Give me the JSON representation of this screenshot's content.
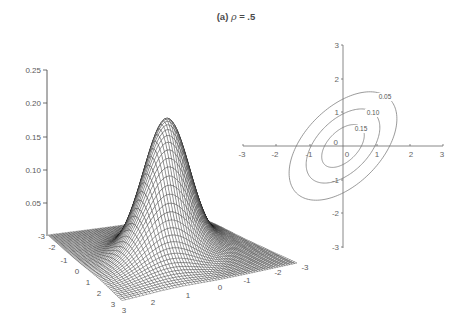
{
  "title": {
    "label": "(a)",
    "symbol": "ρ",
    "value": "= .5"
  },
  "chart_data": [
    {
      "type": "surface",
      "title": "(a) ρ = .5",
      "description": "bivariate normal density surface",
      "rho": 0.5,
      "x_range": [
        -3,
        3
      ],
      "y_range": [
        -3,
        3
      ],
      "zlim": [
        0,
        0.25
      ],
      "peak_value": 0.184,
      "zticks": [
        "0.25",
        "0.20",
        "0.15",
        "0.10",
        "0.05"
      ],
      "left_edge_ticks": [
        "-3",
        "-2",
        "-1",
        "0",
        "1",
        "2",
        "3"
      ],
      "right_edge_ticks": [
        "3",
        "2",
        "1",
        "0",
        "-1",
        "-2",
        "-3"
      ],
      "grid": true
    },
    {
      "type": "contour",
      "title": "(a) ρ = .5",
      "rho": 0.5,
      "levels": [
        0.05,
        0.1,
        0.15
      ],
      "level_labels": [
        "0.05",
        "0.10",
        "0.15"
      ],
      "xlim": [
        -3,
        3
      ],
      "ylim": [
        -3,
        3
      ],
      "xticks": [
        "-3",
        "-2",
        "-1",
        "0",
        "1",
        "2",
        "3"
      ],
      "yticks": [
        "3",
        "2",
        "1",
        "0",
        "-1",
        "-2",
        "-3"
      ]
    }
  ]
}
